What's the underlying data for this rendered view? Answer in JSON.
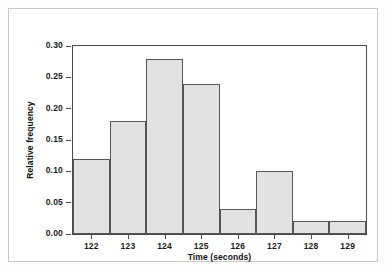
{
  "chart_data": {
    "type": "bar",
    "title": "",
    "subtitle": "",
    "xlabel": "Time (seconds)",
    "ylabel": "Relative frequency",
    "categories": [
      "122",
      "123",
      "124",
      "125",
      "126",
      "127",
      "128",
      "129"
    ],
    "values": [
      0.12,
      0.18,
      0.28,
      0.24,
      0.04,
      0.1,
      0.02,
      0.02
    ],
    "x": [
      122,
      123,
      124,
      125,
      126,
      127,
      128,
      129
    ],
    "bin_width": 1,
    "xlim": [
      121.5,
      129.5
    ],
    "ylim": [
      0.0,
      0.3
    ],
    "ytick_labels": [
      "0.00",
      "0.05",
      "0.10",
      "0.15",
      "0.20",
      "0.25",
      "0.30"
    ],
    "ytick_values": [
      0.0,
      0.05,
      0.1,
      0.15,
      0.2,
      0.25,
      0.3
    ],
    "xtick_labels": [
      "122",
      "123",
      "124",
      "125",
      "126",
      "127",
      "128",
      "129"
    ],
    "grid": false,
    "legend": false,
    "legend_position": "none",
    "bar_fill_color": "#e2e2e2",
    "bar_border_color": "#555555",
    "axis_color": "#4a4a4a",
    "frame_color": "#c9c9c9",
    "background_color": "#ffffff"
  }
}
